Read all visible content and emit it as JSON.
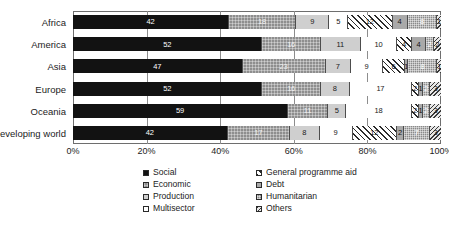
{
  "chart_data": {
    "type": "bar",
    "orientation": "horizontal",
    "stacked": true,
    "normalized_percent": true,
    "title": "",
    "subtitle": "",
    "xlabel": "",
    "ylabel": "",
    "xlim": [
      0,
      100
    ],
    "xticks": [
      "0%",
      "20%",
      "40%",
      "60%",
      "80%",
      "100%"
    ],
    "xtick_values": [
      0,
      20,
      40,
      60,
      80,
      100
    ],
    "grid": true,
    "grid_axis": "x",
    "legend_position": "bottom",
    "categories": [
      "Africa",
      "America",
      "Asia",
      "Europe",
      "Oceania",
      "Developing world"
    ],
    "series": [
      {
        "name": "Social",
        "pattern": "solid-black",
        "values": [
          42,
          52,
          47,
          52,
          59,
          42
        ]
      },
      {
        "name": "Economic",
        "pattern": "gray-grid",
        "values": [
          18,
          16,
          23,
          16,
          11,
          17
        ]
      },
      {
        "name": "Production",
        "pattern": "light-gray",
        "values": [
          9,
          11,
          7,
          8,
          5,
          8
        ]
      },
      {
        "name": "Multisector",
        "pattern": "white",
        "values": [
          5,
          10,
          9,
          17,
          18,
          9
        ]
      },
      {
        "name": "General programme aid",
        "pattern": "diagonal-hatch",
        "values": [
          12,
          4,
          6,
          2,
          2,
          12
        ]
      },
      {
        "name": "Debt",
        "pattern": "mid-gray",
        "values": [
          4,
          4,
          1,
          1,
          1,
          2
        ]
      },
      {
        "name": "Humanitarian",
        "pattern": "gray-dotted",
        "values": [
          8,
          2,
          8,
          2,
          2,
          7
        ]
      },
      {
        "name": "Others",
        "pattern": "cross-hatch",
        "values": [
          1,
          2,
          1,
          3,
          3,
          3
        ]
      }
    ]
  },
  "legend": {
    "items": [
      {
        "label": "Social",
        "swatch": "solid-black-swatch"
      },
      {
        "label": "Economic",
        "swatch": "gray-grid-swatch"
      },
      {
        "label": "Production",
        "swatch": "light-gray-swatch"
      },
      {
        "label": "Multisector",
        "swatch": "white-swatch"
      },
      {
        "label": "General programme aid",
        "swatch": "diagonal-hatch-swatch"
      },
      {
        "label": "Debt",
        "swatch": "mid-gray-swatch"
      },
      {
        "label": "Humanitarian",
        "swatch": "gray-dotted-swatch"
      },
      {
        "label": "Others",
        "swatch": "cross-hatch-swatch"
      }
    ]
  },
  "colors": {
    "social": "#121212",
    "economic": "#8e8e8e",
    "production": "#cfcfcf",
    "multisector": "#ffffff",
    "general_programme_aid": "#2b2b2b",
    "debt": "#a9a9a9",
    "humanitarian": "#8a8a8a",
    "others": "#3a3a3a",
    "axis": "#6e6e6e",
    "grid": "#8d8d8d",
    "text": "#1c1c1c"
  }
}
